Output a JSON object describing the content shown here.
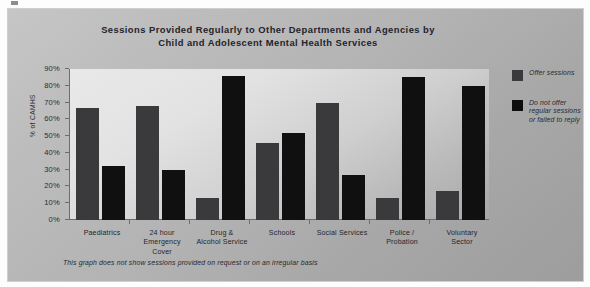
{
  "chart_data": {
    "type": "bar",
    "title": "Sessions Provided Regularly to Other Departments and Agencies by Child and Adolescent Mental Health Services",
    "title_line1": "Sessions Provided Regularly to Other Departments and Agencies by",
    "title_line2": "Child and Adolescent Mental Health Services",
    "xlabel": "",
    "ylabel": "% of CAMHS",
    "ylim": [
      0,
      90
    ],
    "ytick_labels": [
      "90%",
      "80%",
      "70%",
      "60%",
      "50%",
      "40%",
      "30%",
      "20%",
      "10%",
      "0%"
    ],
    "ytick_values": [
      90,
      80,
      70,
      60,
      50,
      40,
      30,
      20,
      10,
      0
    ],
    "grid": false,
    "legend_position": "right",
    "categories": [
      "Paediatrics",
      "24 hour Emergency Cover",
      "Drug & Alcohol Service",
      "Schools",
      "Social Services",
      "Police / Probation",
      "Voluntary Sector"
    ],
    "category_lines": [
      [
        "Paediatrics"
      ],
      [
        "24 hour",
        "Emergency",
        "Cover"
      ],
      [
        "Drug &",
        "Alcohol Service"
      ],
      [
        "Schools"
      ],
      [
        "Social Services"
      ],
      [
        "Police /",
        "Probation"
      ],
      [
        "Voluntary",
        "Sector"
      ]
    ],
    "series": [
      {
        "name": "Offer sessions",
        "color": "#3a3a3c",
        "values": [
          67,
          68,
          13,
          46,
          70,
          13,
          17
        ]
      },
      {
        "name": "Do not offer regular sessions or failed to reply",
        "color": "#101010",
        "values": [
          32,
          30,
          86,
          52,
          27,
          85,
          80
        ]
      }
    ]
  },
  "legend": {
    "items": [
      {
        "label": "Offer sessions",
        "color": "#3a3a3c"
      },
      {
        "label": "Do not offer regular sessions or failed to reply",
        "color": "#101010"
      }
    ],
    "item2_lines": [
      "Do not offer",
      "regular sessions",
      "or failed to reply"
    ]
  },
  "footnote": "This graph does not show sessions provided on request or on an irregular basis"
}
